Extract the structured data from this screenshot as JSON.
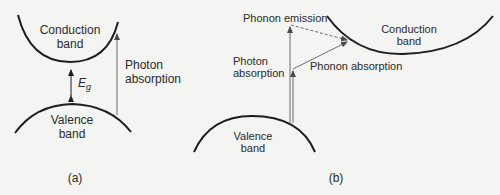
{
  "panel_a": {
    "caption": "(a)",
    "conduction_label_1": "Conduction",
    "conduction_label_2": "band",
    "valence_label_1": "Valence",
    "valence_label_2": "band",
    "gap_label": "E",
    "gap_subscript": "g",
    "photon_label_1": "Photon",
    "photon_label_2": "absorption"
  },
  "panel_b": {
    "caption": "(b)",
    "conduction_label_1": "Conduction",
    "conduction_label_2": "band",
    "valence_label_1": "Valence",
    "valence_label_2": "band",
    "phonon_emission_label": "Phonon emission",
    "photon_label_1": "Photon",
    "photon_label_2": "absorption",
    "phonon_absorption_label": "Phonon absorption"
  },
  "colors": {
    "background": "#f4f4f2",
    "band_curve": "#1e1e1e",
    "arrow": "#6a6a6a",
    "text": "#2a2a2a"
  }
}
